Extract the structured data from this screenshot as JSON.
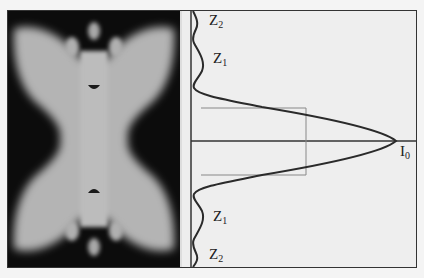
{
  "figure": {
    "left_panel": {
      "description": "intensity pattern image",
      "background_color": "#0c0c0c",
      "pattern_color": "#b8b8b8"
    },
    "right_panel": {
      "description": "intensity profile plot",
      "labels": {
        "z2_top": {
          "main": "Z",
          "sub": "2"
        },
        "z1_top": {
          "main": "Z",
          "sub": "1"
        },
        "peak": {
          "main": "I",
          "sub": "0"
        },
        "z1_bottom": {
          "main": "Z",
          "sub": "1"
        },
        "z2_bottom": {
          "main": "Z",
          "sub": "2"
        }
      },
      "colors": {
        "curve": "#2a2a2a",
        "axis": "#333333",
        "guide_lines": "#888888"
      }
    }
  }
}
